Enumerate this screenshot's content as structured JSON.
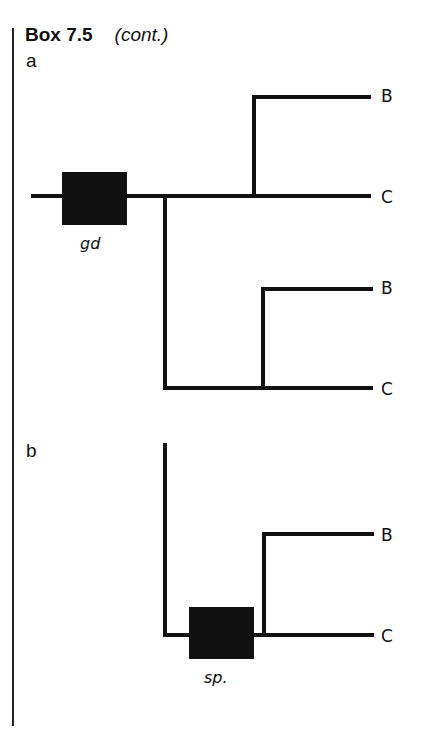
{
  "header": {
    "box_label": "Box 7.5",
    "continuation": "(cont.)"
  },
  "panels": [
    {
      "label": "a",
      "event_label": "gd",
      "tips": [
        "B",
        "C",
        "B",
        "C"
      ]
    },
    {
      "label": "b",
      "event_label": "sp.",
      "tips": [
        "B",
        "C"
      ]
    }
  ],
  "colors": {
    "line": "#111111",
    "border": "#222222",
    "background": "#ffffff"
  }
}
